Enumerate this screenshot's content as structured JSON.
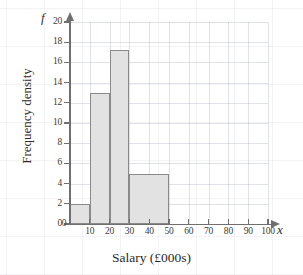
{
  "chart_data": {
    "type": "bar",
    "title": "",
    "xlabel": "Salary (£000s)",
    "ylabel": "Frequency density",
    "x_axis_symbol": "x",
    "y_axis_symbol": "f",
    "xlim": [
      0,
      100
    ],
    "ylim": [
      0,
      20
    ],
    "grid": true,
    "legend": null,
    "x_ticks": [
      0,
      10,
      20,
      30,
      40,
      50,
      60,
      70,
      80,
      90,
      100
    ],
    "x_tick_labels": [
      "0",
      "10",
      "20",
      "30",
      "40",
      "50",
      "60",
      "70",
      "80",
      "90",
      "100"
    ],
    "y_ticks": [
      0,
      2,
      4,
      6,
      8,
      10,
      12,
      14,
      16,
      18,
      20
    ],
    "y_tick_labels": [
      "0",
      "2",
      "4",
      "6",
      "8",
      "10",
      "12",
      "14",
      "16",
      "18",
      "20"
    ],
    "bins": [
      {
        "label": "0-10",
        "start": 0,
        "end": 10,
        "frequency_density": 2
      },
      {
        "label": "10-20",
        "start": 10,
        "end": 20,
        "frequency_density": 13
      },
      {
        "label": "20-30",
        "start": 20,
        "end": 30,
        "frequency_density": 17.2
      },
      {
        "label": "30-50",
        "start": 30,
        "end": 50,
        "frequency_density": 5
      }
    ],
    "bar_fill_color": "#e2e2e2",
    "bar_border_color": "#8a8a8a",
    "axis_color": "#6f6f6f",
    "grid_color": "#96a0b4"
  }
}
